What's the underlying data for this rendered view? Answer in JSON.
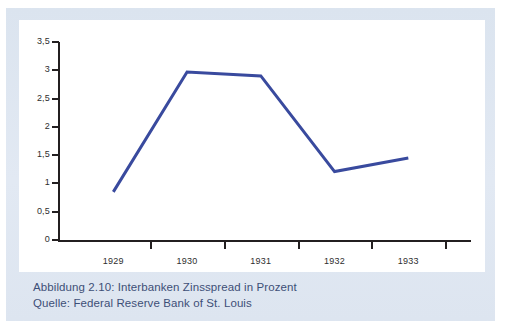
{
  "figure": {
    "caption_line1": "Abbildung 2.10:  Interbanken Zinsspread in Prozent",
    "caption_line2": "Quelle: Federal Reserve Bank of St. Louis",
    "caption_color": "#3d4f77",
    "band_color": "#dde5f0",
    "card_color": "#ffffff"
  },
  "chart_data": {
    "type": "line",
    "title": "Interbanken Zinsspread in Prozent",
    "subtitle": "Quelle: Federal Reserve Bank of St. Louis",
    "xlabel": "",
    "ylabel": "",
    "categories": [
      "1929",
      "1930",
      "1931",
      "1932",
      "1933"
    ],
    "values": [
      0.85,
      2.97,
      2.9,
      1.21,
      1.45
    ],
    "series": [
      {
        "name": "Interbanken Zinsspread",
        "color": "#394a9e",
        "values": [
          0.85,
          2.97,
          2.9,
          1.21,
          1.45
        ]
      }
    ],
    "ylim": [
      0,
      3.5
    ],
    "yticks": [
      0,
      0.5,
      1,
      1.5,
      2,
      2.5,
      3,
      3.5
    ],
    "ytick_labels": [
      "0",
      "0,5",
      "1",
      "1,5",
      "2",
      "2,5",
      "3",
      "3,5"
    ],
    "xtick_labels": [
      "1929",
      "1930",
      "1931",
      "1932",
      "1933"
    ],
    "grid": false,
    "legend": "none",
    "line_color": "#394a9e",
    "line_width": 3,
    "axis_color": "#231f20"
  }
}
